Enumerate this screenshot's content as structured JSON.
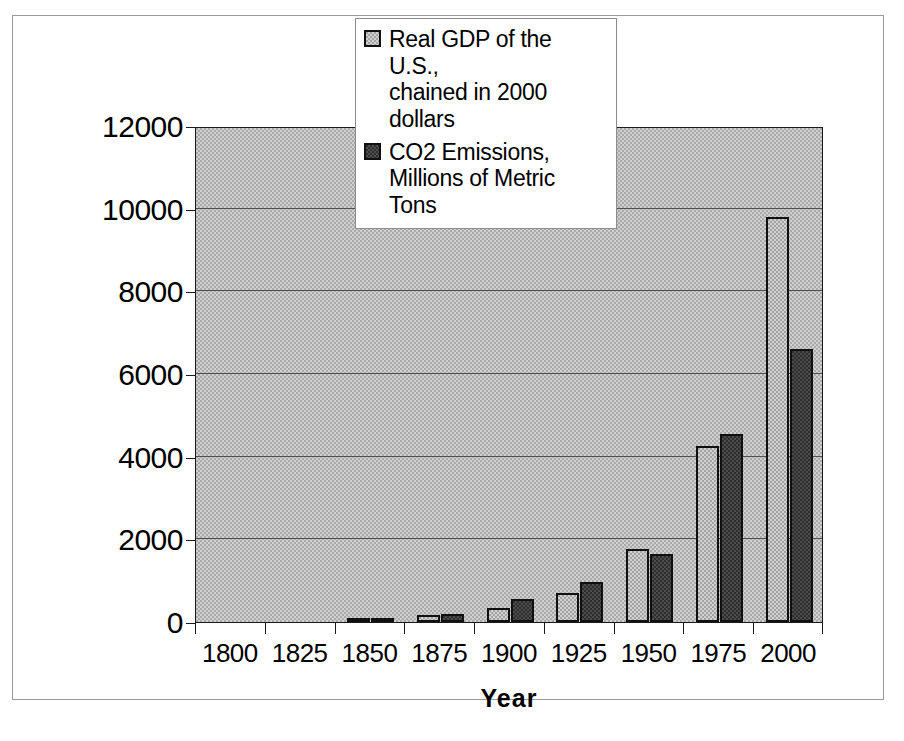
{
  "chart_data": {
    "type": "bar",
    "title": "",
    "xlabel": "Year",
    "ylabel": "",
    "categories": [
      "1800",
      "1825",
      "1850",
      "1875",
      "1900",
      "1925",
      "1950",
      "1975",
      "2000"
    ],
    "series": [
      {
        "name": "Real GDP of the U.S., chained in 2000 dollars",
        "color": "#a3a3a3",
        "values": [
          0,
          0,
          60,
          160,
          340,
          710,
          1760,
          4250,
          9800
        ]
      },
      {
        "name": "CO2 Emissions, Millions of Metric Tons",
        "color": "#2e2e2e",
        "values": [
          0,
          0,
          50,
          190,
          545,
          960,
          1640,
          4550,
          6600
        ]
      }
    ],
    "ylim": [
      0,
      12000
    ],
    "yticks": [
      0,
      2000,
      4000,
      6000,
      8000,
      10000,
      12000
    ],
    "ytick_labels": [
      "0",
      "2000",
      "4000",
      "6000",
      "8000",
      "10000",
      "12000"
    ],
    "grid": true,
    "legend_position": "top-center",
    "plot_background": "#a9a9a9"
  },
  "legend": {
    "items": [
      {
        "line1": "Real GDP of the U.S.,",
        "line2": "chained in 2000 dollars",
        "swatch": "gdp-swatch"
      },
      {
        "line1": "CO2 Emissions,",
        "line2": "Millions of Metric Tons",
        "swatch": "co2-swatch"
      }
    ]
  },
  "axis": {
    "x_title": "Year"
  }
}
